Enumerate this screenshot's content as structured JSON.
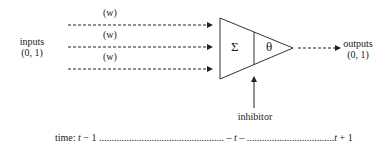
{
  "diagram": {
    "inputs_label": "inputs",
    "inputs_range": "(0, 1)",
    "weights": [
      "(w)",
      "(w)",
      "(w)"
    ],
    "sum_symbol": "Σ",
    "threshold_symbol": "θ",
    "outputs_label": "outputs",
    "outputs_range": "(0, 1)",
    "inhibitor_label": "inhibitor",
    "time": {
      "prefix": "time:",
      "t_minus_1_var": "t",
      "t_minus_1_op": " − 1 ",
      "dots_1": "..................................................",
      "middle": " – t – ",
      "dots_2": "...................................",
      "t_plus_1_var": "t",
      "t_plus_1_op": " + 1"
    }
  }
}
